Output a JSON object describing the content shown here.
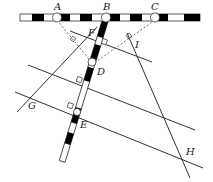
{
  "diagram": {
    "type": "geometry-surveying-figure",
    "labels": {
      "A": "A",
      "B": "B",
      "C": "C",
      "D": "D",
      "E": "E",
      "F": "F",
      "G": "G",
      "H": "H",
      "I": "I"
    },
    "colors": {
      "stroke": "#333333",
      "rod_black": "#000000",
      "rod_white": "#ffffff",
      "background": "#ffffff"
    }
  }
}
